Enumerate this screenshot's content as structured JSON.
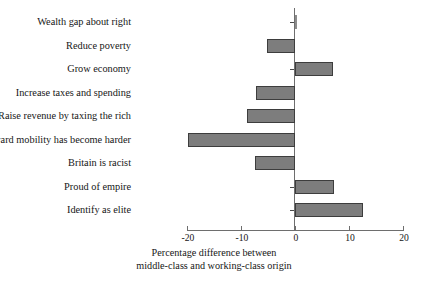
{
  "chart_data": {
    "type": "bar",
    "orientation": "horizontal",
    "title": "",
    "subtitle": "",
    "xlabel": "Percentage difference between middle-class and working-class origin",
    "xlabel_lines": [
      "Percentage difference between",
      "middle-class and working-class origin"
    ],
    "ylabel": "",
    "categories": [
      "Wealth gap about right",
      "Reduce poverty",
      "Grow economy",
      "Increase taxes and spending",
      "Raise revenue by taxing the rich",
      "Upward mobility has become harder",
      "Britain is racist",
      "Proud of empire",
      "Identify as elite"
    ],
    "values": [
      0.3,
      -5.2,
      7.1,
      -7.3,
      -8.9,
      -19.8,
      -7.5,
      7.3,
      12.6
    ],
    "xlim": [
      -20,
      20
    ],
    "xticks": [
      -20,
      -10,
      0,
      20
    ],
    "xtick_labels": [
      "-20",
      "-10",
      "0",
      "10",
      "20"
    ],
    "xticks_all": [
      -20,
      -10,
      0,
      10,
      20
    ],
    "grid": false,
    "legend": false,
    "legend_position": "none",
    "bar_color": "#7d7d7d",
    "bar_edge_color": "#3d3d3d",
    "axis_color": "#6e6e6e",
    "background": "#ffffff"
  },
  "axis": {
    "tick_labels": [
      "-20",
      "-10",
      "0",
      "10",
      "20"
    ],
    "title_line1": "Percentage difference between",
    "title_line2": "middle-class and working-class origin"
  },
  "categories": {
    "c0": "Wealth gap about right",
    "c1": "Reduce poverty",
    "c2": "Grow economy",
    "c3": "Increase taxes and spending",
    "c4": "Raise revenue by taxing the rich",
    "c5": "Upward mobility has become harder",
    "c6": "Britain is racist",
    "c7": "Proud of empire",
    "c8": "Identify as elite"
  }
}
